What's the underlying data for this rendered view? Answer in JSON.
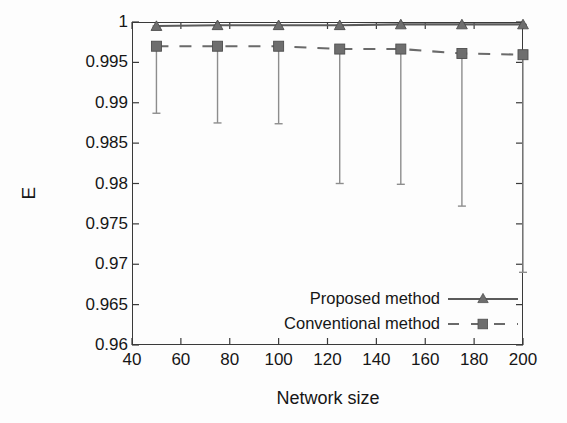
{
  "chart_data": {
    "type": "line",
    "title": "",
    "xlabel": "Network size",
    "ylabel": "E",
    "xlim": [
      40,
      200
    ],
    "ylim": [
      0.96,
      1.0
    ],
    "xticks": [
      40,
      60,
      80,
      100,
      120,
      140,
      160,
      180,
      200
    ],
    "yticks": [
      0.96,
      0.965,
      0.97,
      0.975,
      0.98,
      0.985,
      0.99,
      0.995,
      1
    ],
    "xticklabels": [
      "40",
      "60",
      "80",
      "100",
      "120",
      "140",
      "160",
      "180",
      "200"
    ],
    "yticklabels": [
      "0.96",
      "0.965",
      "0.97",
      "0.975",
      "0.98",
      "0.985",
      "0.99",
      "0.995",
      "1"
    ],
    "grid": false,
    "legend_position": "lower right",
    "x": [
      50,
      75,
      100,
      125,
      150,
      175,
      200
    ],
    "series": [
      {
        "name": "Proposed method",
        "marker": "triangle",
        "linestyle": "solid",
        "color": "#5b5b5b",
        "values": [
          0.9995,
          0.9996,
          0.9996,
          0.9996,
          0.9997,
          0.9997,
          0.9997
        ],
        "errorbar_low": [
          0.9993,
          0.9994,
          0.9994,
          0.9994,
          0.9995,
          0.9995,
          0.9995
        ]
      },
      {
        "name": "Conventional method",
        "marker": "square",
        "linestyle": "dashed",
        "color": "#6a6a6a",
        "values": [
          0.997,
          0.997,
          0.997,
          0.99665,
          0.99665,
          0.9961,
          0.99595
        ],
        "errorbar_low": [
          0.9887,
          0.9875,
          0.9874,
          0.98,
          0.9799,
          0.9772,
          0.969
        ]
      }
    ]
  },
  "axes": {
    "ylabel": "E",
    "xlabel": "Network size"
  },
  "legend": {
    "items": [
      {
        "label": "Proposed method",
        "style": "solid-triangle"
      },
      {
        "label": "Conventional method",
        "style": "dashed-square"
      }
    ]
  },
  "colors": {
    "axis": "#3a3a3a",
    "text": "#161616",
    "proposed": "#5b5b5b",
    "conventional": "#6a6a6a",
    "errorbar": "#8d8d8d",
    "background": "#fdfdfd"
  }
}
